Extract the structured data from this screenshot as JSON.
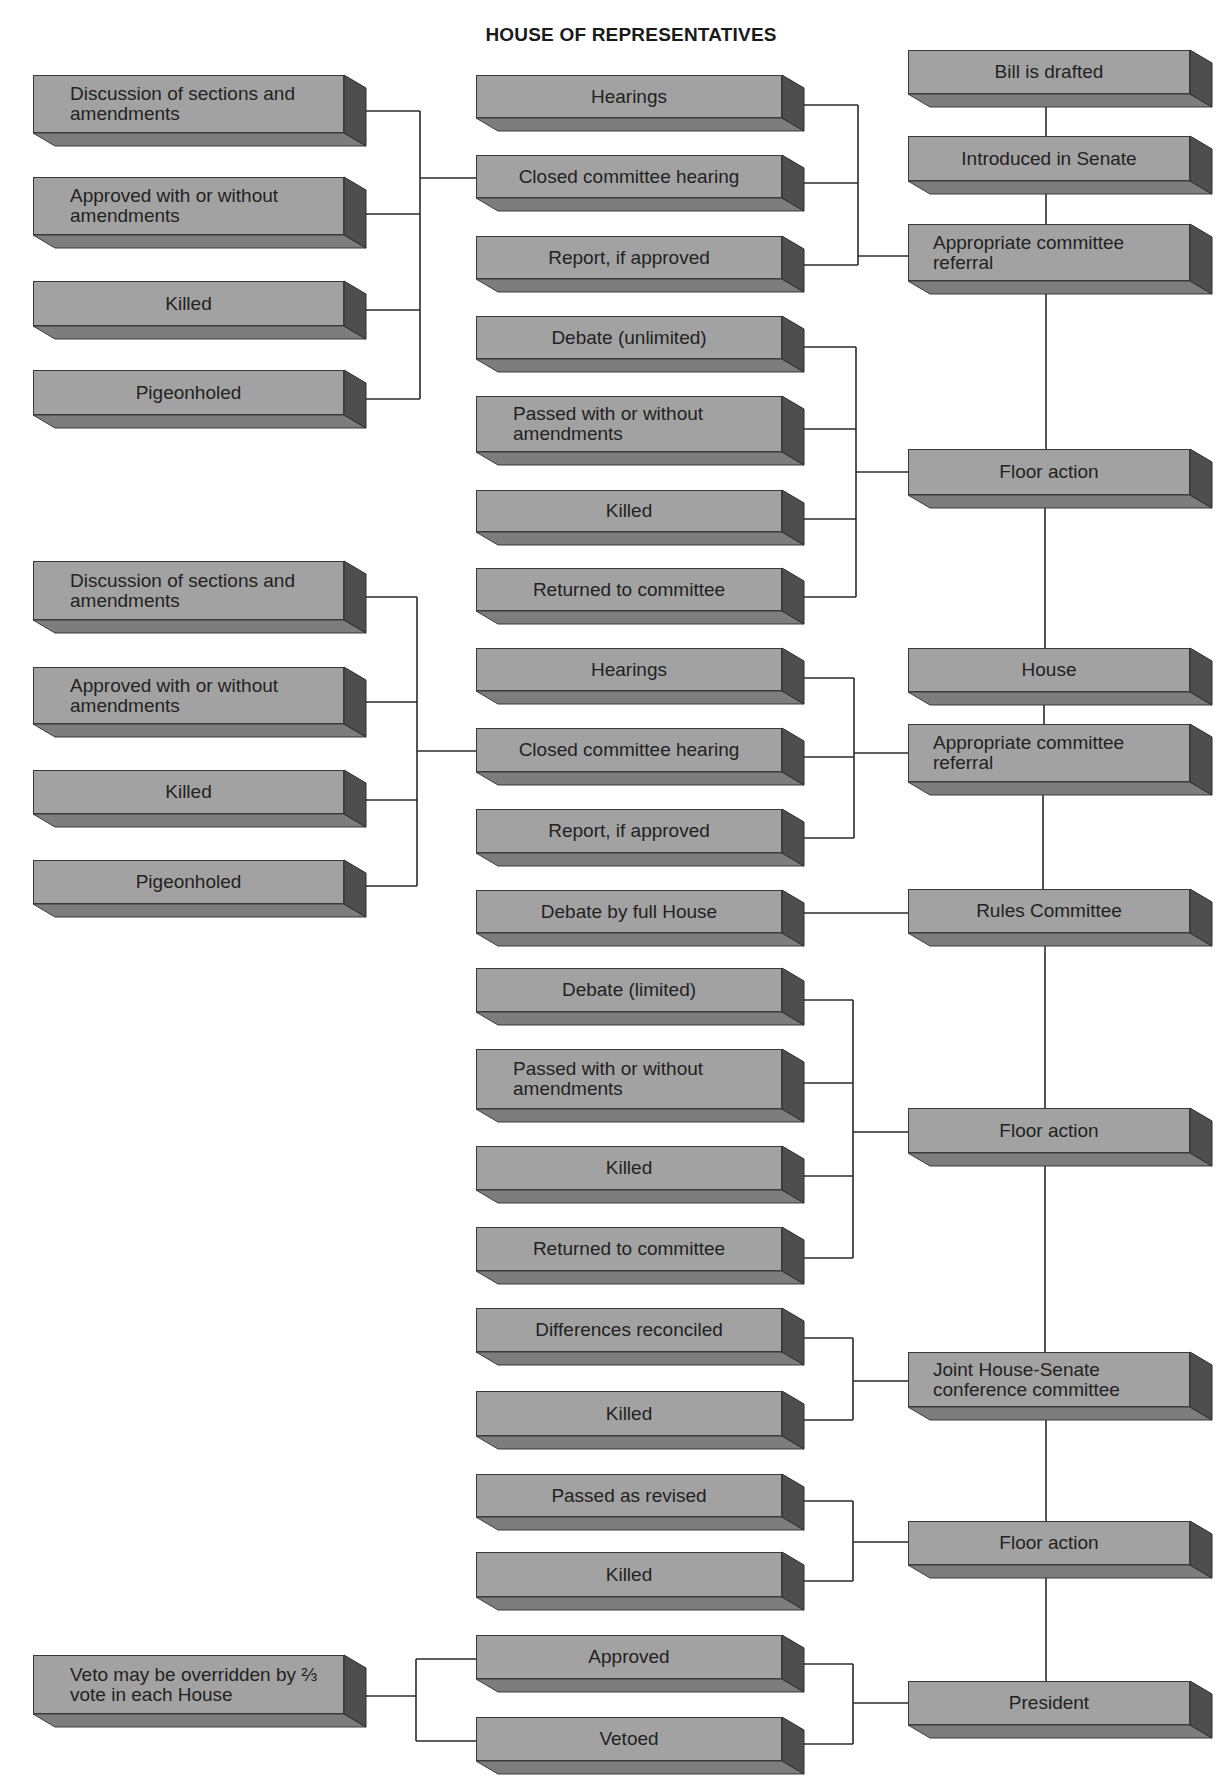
{
  "title": "HOUSE OF REPRESENTATIVES",
  "left_column": {
    "senate_committee_outcomes": [
      {
        "label": "Discussion of sections and amendments"
      },
      {
        "label": "Approved with or without amendments"
      },
      {
        "label": "Killed"
      },
      {
        "label": "Pigeonholed"
      }
    ],
    "house_committee_outcomes": [
      {
        "label": "Discussion of sections and amendments"
      },
      {
        "label": "Approved with or without amendments"
      },
      {
        "label": "Killed"
      },
      {
        "label": "Pigeonholed"
      }
    ],
    "veto_override": {
      "label": "Veto may be overridden by ⅔ vote in each House"
    }
  },
  "middle_column": {
    "senate_committee": [
      {
        "label": "Hearings"
      },
      {
        "label": "Closed committee hearing"
      },
      {
        "label": "Report, if approved"
      }
    ],
    "senate_floor": [
      {
        "label": "Debate (unlimited)"
      },
      {
        "label": "Passed with or without amendments"
      },
      {
        "label": "Killed"
      },
      {
        "label": "Returned to committee"
      }
    ],
    "house_committee": [
      {
        "label": "Hearings"
      },
      {
        "label": "Closed committee hearing"
      },
      {
        "label": "Report, if approved"
      }
    ],
    "rules": [
      {
        "label": "Debate by full House"
      }
    ],
    "house_floor": [
      {
        "label": "Debate (limited)"
      },
      {
        "label": "Passed with or without amendments"
      },
      {
        "label": "Killed"
      },
      {
        "label": "Returned to committee"
      }
    ],
    "conference": [
      {
        "label": "Differences reconciled"
      },
      {
        "label": "Killed"
      }
    ],
    "final_floor": [
      {
        "label": "Passed as revised"
      },
      {
        "label": "Killed"
      }
    ],
    "president": [
      {
        "label": "Approved"
      },
      {
        "label": "Vetoed"
      }
    ]
  },
  "main_sequence": [
    {
      "label": "Bill is drafted"
    },
    {
      "label": "Introduced in Senate"
    },
    {
      "label": "Appropriate committee referral"
    },
    {
      "label": "Floor action"
    },
    {
      "label": "House"
    },
    {
      "label": "Appropriate committee referral"
    },
    {
      "label": "Rules Committee"
    },
    {
      "label": "Floor action"
    },
    {
      "label": "Joint House-Senate conference committee"
    },
    {
      "label": "Floor action"
    },
    {
      "label": "President"
    }
  ],
  "colors": {
    "box_face": "#a2a2a2",
    "box_bottom": "#7d7d7d",
    "box_side": "#4e4e4e",
    "line": "#2a2a2a",
    "text": "#222222"
  }
}
